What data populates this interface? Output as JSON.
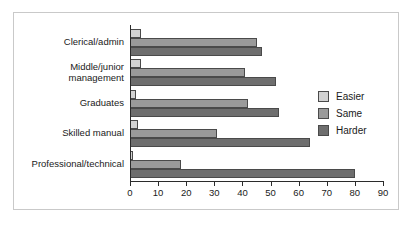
{
  "chart_data": {
    "type": "bar",
    "orientation": "horizontal",
    "title": "",
    "xlabel": "",
    "ylabel": "",
    "xlim": [
      0,
      90
    ],
    "xticks": [
      0,
      10,
      20,
      30,
      40,
      50,
      60,
      70,
      80,
      90
    ],
    "xtick_labels": [
      "0",
      "10",
      "20",
      "30",
      "40",
      "50",
      "60",
      "70",
      "80",
      "90"
    ],
    "grid": false,
    "legend_position": "right",
    "categories": [
      "Clerical/admin",
      "Middle/junior\nmanagement",
      "Graduates",
      "Skilled manual",
      "Professional/technical"
    ],
    "series": [
      {
        "name": "Easier",
        "color": "#d2d2d2",
        "values": [
          4,
          4,
          2,
          3,
          1
        ]
      },
      {
        "name": "Same",
        "color": "#9a9a9a",
        "values": [
          45,
          41,
          42,
          31,
          18
        ]
      },
      {
        "name": "Harder",
        "color": "#6e6e6e",
        "values": [
          47,
          52,
          53,
          64,
          80
        ]
      }
    ]
  },
  "legend": {
    "items": [
      {
        "label": "Easier",
        "color": "#d2d2d2"
      },
      {
        "label": "Same",
        "color": "#9a9a9a"
      },
      {
        "label": "Harder",
        "color": "#6e6e6e"
      }
    ]
  },
  "axis": {
    "tick_labels": [
      "0",
      "10",
      "20",
      "30",
      "40",
      "50",
      "60",
      "70",
      "80",
      "90"
    ]
  },
  "categories": [
    "Clerical/admin",
    "Middle/junior\nmanagement",
    "Graduates",
    "Skilled manual",
    "Professional/technical"
  ]
}
